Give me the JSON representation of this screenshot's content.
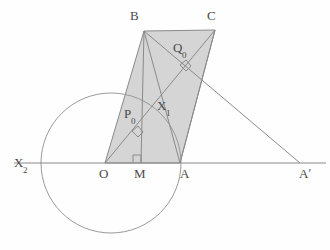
{
  "figure": {
    "canvas": {
      "width": 330,
      "height": 250
    },
    "colors": {
      "background": "#fefefe",
      "line": "#8a8a8a",
      "fill": "#d5d5d5",
      "label": "#4a4a4a",
      "circle": "#9a9a9a"
    }
  },
  "points": {
    "O": {
      "label": "O",
      "x": 105,
      "y": 163,
      "label_x": 99,
      "label_y": 167
    },
    "M": {
      "label": "M",
      "x": 141,
      "y": 163,
      "label_x": 134,
      "label_y": 167
    },
    "A": {
      "label": "A",
      "x": 180,
      "y": 163,
      "label_x": 180,
      "label_y": 167
    },
    "B": {
      "label": "B",
      "x": 144,
      "y": 31,
      "label_x": 130,
      "label_y": 9
    },
    "C": {
      "label": "C",
      "x": 215,
      "y": 30,
      "label_x": 207,
      "label_y": 9
    },
    "Aprime": {
      "label": "A",
      "prime": "′",
      "x": 300,
      "y": 163,
      "label_x": 299,
      "label_y": 167
    },
    "X2": {
      "label": "X",
      "sub": "2",
      "x": 41,
      "y": 163,
      "label_x": 14,
      "label_y": 156
    },
    "X1": {
      "label": "X",
      "sub": "1",
      "x": 160,
      "y": 116,
      "label_x": 157,
      "label_y": 99
    },
    "P0": {
      "label": "P",
      "sub": "0",
      "x": 138,
      "y": 133,
      "label_x": 124,
      "label_y": 107
    },
    "Q0": {
      "label": "Q",
      "sub": "0",
      "x": 186,
      "y": 67,
      "label_x": 173,
      "label_y": 41
    }
  },
  "shapes": {
    "quadrilateral": {
      "name": "OBCA",
      "vertices": "105,163 144,31 215,30 180,163",
      "fill": "#d5d5d5",
      "stroke": "#8a8a8a"
    },
    "circle": {
      "cx": 111,
      "cy": 163,
      "r": 70,
      "stroke": "#9a9a9a"
    },
    "axis": {
      "x1": 14,
      "y1": 163,
      "x2": 326,
      "y2": 163
    },
    "segments": [
      {
        "name": "diagonal-O-C",
        "x1": 105,
        "y1": 163,
        "x2": 215,
        "y2": 30
      },
      {
        "name": "diagonal-B-A",
        "x1": 144,
        "y1": 31,
        "x2": 180,
        "y2": 163
      },
      {
        "name": "ray-B-to-Aprime",
        "x1": 144,
        "y1": 31,
        "x2": 300,
        "y2": 163
      },
      {
        "name": "segment-A-Aprime",
        "x1": 180,
        "y1": 163,
        "x2": 300,
        "y2": 163
      },
      {
        "name": "altitude-M-B",
        "x1": 141,
        "y1": 163,
        "x2": 144,
        "y2": 31
      },
      {
        "name": "side-C-A",
        "x1": 215,
        "y1": 30,
        "x2": 180,
        "y2": 163
      }
    ],
    "right_angles": [
      {
        "name": "right-angle-at-M",
        "x": 141,
        "y": 163,
        "size": 8,
        "rotation": 0
      },
      {
        "name": "right-angle-at-P0",
        "x": 138,
        "y": 133,
        "size": 7,
        "rotation": 40
      },
      {
        "name": "right-angle-at-Q0",
        "x": 186,
        "y": 67,
        "size": 7,
        "rotation": 40
      }
    ]
  }
}
